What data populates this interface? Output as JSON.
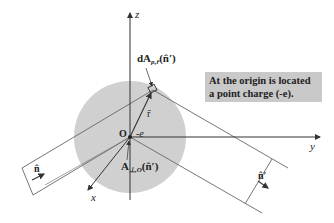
{
  "diagram": {
    "axes": {
      "z_label": "z",
      "y_label": "y",
      "x_label": "x"
    },
    "origin_label": "O",
    "charge_label": "-e",
    "position_vector_label": "r̄",
    "area_element_top": {
      "main": "dA",
      "subscript": "ρ,r̄",
      "suffix": "(n̂′)"
    },
    "area_element_bottom": {
      "main": "A",
      "subscript": "⊥,O",
      "suffix": "(n̂′)"
    },
    "normal_left_label": "n̂",
    "normal_right_label": "n̂′",
    "info_box": {
      "line1": "At the origin is located",
      "line2": "a point charge (-e)."
    },
    "colors": {
      "sphere_fill": "#d0d0d0",
      "box_fill": "#c9c9c9",
      "line": "#555555"
    }
  }
}
